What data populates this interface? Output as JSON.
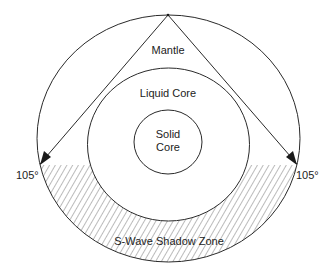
{
  "diagram": {
    "layers": {
      "mantle": "Mantle",
      "liquid_core": "Liquid Core",
      "solid_core_line1": "Solid",
      "solid_core_line2": "Core"
    },
    "shadow_zone_label": "S-Wave Shadow Zone",
    "angle_left": "105°",
    "angle_right": "105°",
    "colors": {
      "line": "#2a2a2a",
      "hatch": "#555555",
      "background": "#ffffff"
    }
  }
}
